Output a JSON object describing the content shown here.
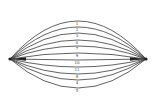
{
  "diagram": {
    "left_node": {
      "x": 10,
      "y": 59
    },
    "right_node": {
      "x": 146,
      "y": 59
    },
    "stroke_color": "#3a3a3a",
    "curves": [
      {
        "label": "1",
        "mid_y": 21
      },
      {
        "label": "2",
        "mid_y": 27
      },
      {
        "label": "3",
        "mid_y": 33
      },
      {
        "label": "6",
        "mid_y": 40
      },
      {
        "label": "7",
        "mid_y": 46
      },
      {
        "label": "9",
        "mid_y": 53
      },
      {
        "label": "10",
        "mid_y": 60
      },
      {
        "label": "11",
        "mid_y": 67
      },
      {
        "label": "8",
        "mid_y": 74
      },
      {
        "label": "4",
        "mid_y": 80
      },
      {
        "label": "5",
        "mid_y": 88
      }
    ]
  }
}
